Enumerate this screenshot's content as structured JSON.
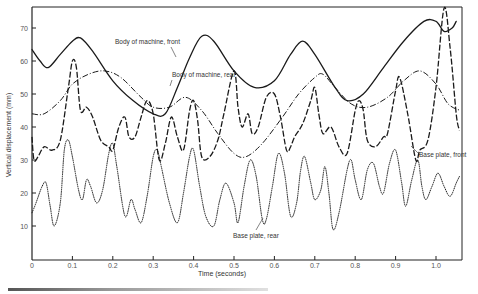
{
  "chart_data": {
    "type": "line",
    "title": "",
    "xlabel": "Time (seconds)",
    "ylabel": "Vertical displacement (mm)",
    "xlim": [
      0,
      1.06
    ],
    "ylim": [
      0,
      76
    ],
    "grid": false,
    "x_ticks": [
      0,
      0.1,
      0.2,
      0.3,
      0.4,
      0.5,
      0.6,
      0.7,
      0.8,
      0.9,
      1.0
    ],
    "x_tick_labels": [
      "0",
      "0.1",
      "0.2",
      "0.3",
      "0.4",
      "0.5",
      "0.6",
      "0.7",
      "0.8",
      "0.9",
      "1.0"
    ],
    "y_ticks": [
      10,
      20,
      30,
      40,
      50,
      60,
      70
    ],
    "y_tick_labels": [
      "10",
      "20",
      "30",
      "40",
      "50",
      "60",
      "70"
    ],
    "legend": "inline annotations",
    "series": [
      {
        "name": "Body of machine, front",
        "style": "solid",
        "points": [
          [
            0,
            63.5
          ],
          [
            0.02,
            60
          ],
          [
            0.04,
            58
          ],
          [
            0.07,
            62
          ],
          [
            0.1,
            66
          ],
          [
            0.12,
            67
          ],
          [
            0.15,
            63
          ],
          [
            0.2,
            54
          ],
          [
            0.25,
            48
          ],
          [
            0.3,
            44
          ],
          [
            0.33,
            44
          ],
          [
            0.36,
            52
          ],
          [
            0.39,
            61
          ],
          [
            0.42,
            67.5
          ],
          [
            0.45,
            66
          ],
          [
            0.5,
            57
          ],
          [
            0.55,
            52
          ],
          [
            0.6,
            54
          ],
          [
            0.64,
            62
          ],
          [
            0.67,
            66
          ],
          [
            0.7,
            62
          ],
          [
            0.75,
            52
          ],
          [
            0.78,
            48
          ],
          [
            0.82,
            50
          ],
          [
            0.87,
            58
          ],
          [
            0.92,
            66
          ],
          [
            0.97,
            72
          ],
          [
            1.0,
            72
          ],
          [
            1.02,
            69
          ],
          [
            1.04,
            70
          ],
          [
            1.05,
            72
          ]
        ]
      },
      {
        "name": "Body of machine, rear",
        "style": "dashdot",
        "points": [
          [
            0,
            44
          ],
          [
            0.03,
            44
          ],
          [
            0.07,
            48
          ],
          [
            0.1,
            53
          ],
          [
            0.14,
            56
          ],
          [
            0.18,
            57
          ],
          [
            0.22,
            55
          ],
          [
            0.27,
            49
          ],
          [
            0.3,
            46
          ],
          [
            0.34,
            46
          ],
          [
            0.38,
            49
          ],
          [
            0.42,
            45
          ],
          [
            0.46,
            38
          ],
          [
            0.5,
            32
          ],
          [
            0.53,
            31
          ],
          [
            0.57,
            35
          ],
          [
            0.62,
            43
          ],
          [
            0.66,
            50
          ],
          [
            0.7,
            55
          ],
          [
            0.72,
            56
          ],
          [
            0.75,
            52
          ],
          [
            0.79,
            47
          ],
          [
            0.83,
            46
          ],
          [
            0.88,
            49
          ],
          [
            0.92,
            54
          ],
          [
            0.96,
            57
          ],
          [
            1.0,
            53
          ],
          [
            1.03,
            47
          ],
          [
            1.06,
            45
          ]
        ]
      },
      {
        "name": "Base plate, front",
        "style": "dashed",
        "points": [
          [
            0,
            37
          ],
          [
            0.005,
            30
          ],
          [
            0.015,
            31
          ],
          [
            0.03,
            34
          ],
          [
            0.05,
            33
          ],
          [
            0.07,
            36
          ],
          [
            0.09,
            52
          ],
          [
            0.1,
            60
          ],
          [
            0.11,
            58
          ],
          [
            0.12,
            45
          ],
          [
            0.135,
            46
          ],
          [
            0.15,
            43
          ],
          [
            0.17,
            36
          ],
          [
            0.19,
            34
          ],
          [
            0.2,
            33
          ],
          [
            0.215,
            40
          ],
          [
            0.23,
            43
          ],
          [
            0.24,
            37
          ],
          [
            0.255,
            37
          ],
          [
            0.27,
            43
          ],
          [
            0.285,
            48
          ],
          [
            0.3,
            44
          ],
          [
            0.315,
            30
          ],
          [
            0.33,
            35
          ],
          [
            0.345,
            43
          ],
          [
            0.36,
            37
          ],
          [
            0.375,
            33
          ],
          [
            0.39,
            45
          ],
          [
            0.4,
            48
          ],
          [
            0.41,
            42
          ],
          [
            0.42,
            31
          ],
          [
            0.44,
            31
          ],
          [
            0.46,
            36
          ],
          [
            0.475,
            44
          ],
          [
            0.5,
            57
          ],
          [
            0.51,
            46
          ],
          [
            0.52,
            40
          ],
          [
            0.535,
            44
          ],
          [
            0.545,
            38
          ],
          [
            0.56,
            40
          ],
          [
            0.58,
            49
          ],
          [
            0.6,
            50
          ],
          [
            0.615,
            43
          ],
          [
            0.63,
            33
          ],
          [
            0.64,
            34
          ],
          [
            0.65,
            37
          ],
          [
            0.67,
            41
          ],
          [
            0.69,
            48
          ],
          [
            0.7,
            52
          ],
          [
            0.71,
            44
          ],
          [
            0.72,
            38
          ],
          [
            0.74,
            40
          ],
          [
            0.76,
            34
          ],
          [
            0.78,
            32
          ],
          [
            0.8,
            45
          ],
          [
            0.81,
            48
          ],
          [
            0.82,
            45
          ],
          [
            0.83,
            36
          ],
          [
            0.85,
            34
          ],
          [
            0.87,
            37
          ],
          [
            0.88,
            38
          ],
          [
            0.9,
            51
          ],
          [
            0.91,
            55
          ],
          [
            0.93,
            44
          ],
          [
            0.95,
            30
          ],
          [
            0.96,
            33
          ],
          [
            0.98,
            36
          ],
          [
            1.0,
            52
          ],
          [
            1.02,
            76
          ],
          [
            1.035,
            64
          ],
          [
            1.05,
            44
          ],
          [
            1.058,
            39
          ]
        ]
      },
      {
        "name": "Base plate, rear",
        "style": "dotted",
        "points": [
          [
            0,
            14
          ],
          [
            0.01,
            17
          ],
          [
            0.025,
            22
          ],
          [
            0.035,
            23
          ],
          [
            0.045,
            16
          ],
          [
            0.055,
            10
          ],
          [
            0.07,
            17
          ],
          [
            0.08,
            33
          ],
          [
            0.09,
            36
          ],
          [
            0.1,
            31
          ],
          [
            0.115,
            21
          ],
          [
            0.125,
            18
          ],
          [
            0.135,
            24
          ],
          [
            0.145,
            22
          ],
          [
            0.16,
            17
          ],
          [
            0.175,
            21
          ],
          [
            0.19,
            32
          ],
          [
            0.2,
            35
          ],
          [
            0.21,
            28
          ],
          [
            0.23,
            13
          ],
          [
            0.245,
            18
          ],
          [
            0.255,
            15
          ],
          [
            0.27,
            11
          ],
          [
            0.285,
            19
          ],
          [
            0.3,
            31
          ],
          [
            0.31,
            33
          ],
          [
            0.32,
            28
          ],
          [
            0.34,
            17
          ],
          [
            0.36,
            11
          ],
          [
            0.375,
            20
          ],
          [
            0.39,
            31
          ],
          [
            0.4,
            33
          ],
          [
            0.415,
            22
          ],
          [
            0.43,
            13
          ],
          [
            0.45,
            10
          ],
          [
            0.465,
            18
          ],
          [
            0.48,
            23
          ],
          [
            0.5,
            17
          ],
          [
            0.51,
            11
          ],
          [
            0.525,
            22
          ],
          [
            0.54,
            30
          ],
          [
            0.555,
            25
          ],
          [
            0.57,
            12
          ],
          [
            0.58,
            12
          ],
          [
            0.595,
            22
          ],
          [
            0.61,
            32
          ],
          [
            0.625,
            26
          ],
          [
            0.64,
            13
          ],
          [
            0.655,
            17
          ],
          [
            0.665,
            27
          ],
          [
            0.675,
            31
          ],
          [
            0.69,
            23
          ],
          [
            0.7,
            18
          ],
          [
            0.715,
            21
          ],
          [
            0.725,
            28
          ],
          [
            0.735,
            20
          ],
          [
            0.745,
            9
          ],
          [
            0.76,
            14
          ],
          [
            0.78,
            27
          ],
          [
            0.79,
            30
          ],
          [
            0.8,
            24
          ],
          [
            0.815,
            18
          ],
          [
            0.83,
            27
          ],
          [
            0.845,
            29
          ],
          [
            0.86,
            22
          ],
          [
            0.87,
            20
          ],
          [
            0.885,
            29
          ],
          [
            0.9,
            33
          ],
          [
            0.915,
            23
          ],
          [
            0.925,
            16
          ],
          [
            0.94,
            24
          ],
          [
            0.955,
            30
          ],
          [
            0.965,
            22
          ],
          [
            0.975,
            18
          ],
          [
            0.99,
            22
          ],
          [
            1.005,
            26
          ],
          [
            1.02,
            22
          ],
          [
            1.035,
            19
          ],
          [
            1.05,
            23
          ],
          [
            1.058,
            25
          ]
        ]
      }
    ],
    "annotations": [
      {
        "text": "Body of machine, front",
        "series": "Body of machine, front"
      },
      {
        "text": "Body of machine, rear",
        "series": "Body of machine, rear"
      },
      {
        "text": "Base plate, front",
        "series": "Base plate, front"
      },
      {
        "text": "Base plate, rear",
        "series": "Base plate, rear"
      }
    ]
  },
  "labels": {
    "xlabel": "Time (seconds)",
    "ylabel": "Vertical displacement (mm)",
    "annot_body_front": "Body of machine, front",
    "annot_body_rear": "Body of machine, rear",
    "annot_base_front": "Base plate, front",
    "annot_base_rear": "Base plate, rear"
  }
}
